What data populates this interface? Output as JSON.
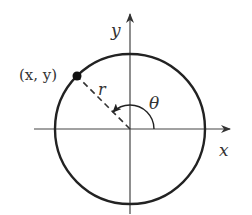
{
  "diagram": {
    "type": "unit-circle-polar",
    "labels": {
      "y_axis": "y",
      "x_axis": "x",
      "point": "(x, y)",
      "radius": "r",
      "angle": "θ"
    },
    "colors": {
      "stroke": "#222222",
      "axis": "#444444",
      "text": "#333333"
    }
  }
}
